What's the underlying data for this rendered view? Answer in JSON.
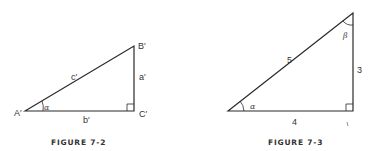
{
  "figures": [
    {
      "caption": "FIGURE 7-2",
      "vertices": {
        "A": "A′",
        "B": "B′",
        "C": "C′"
      },
      "sides": {
        "hypotenuse": "c′",
        "vertical": "a′",
        "base": "b′"
      },
      "angles": {
        "at_A": "α"
      },
      "right_angle_at": "C′"
    },
    {
      "caption": "FIGURE 7-3",
      "sides": {
        "hypotenuse": "5",
        "vertical": "3",
        "base": "4"
      },
      "angles": {
        "at_left": "α",
        "at_top": "β"
      },
      "right_angle_at": "bottom-right"
    }
  ],
  "colors": {
    "line": "#2a2a2a",
    "background": "#ffffff"
  }
}
